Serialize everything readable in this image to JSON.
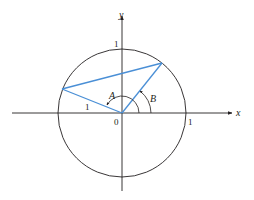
{
  "diagram": {
    "type": "unit-circle",
    "colors": {
      "axis": "#231f20",
      "circle": "#231f20",
      "radii_and_chord": "#4a8fd6",
      "background": "#ffffff"
    },
    "axes": {
      "x_label": "x",
      "y_label": "y",
      "origin_label": "0",
      "x_tick_label": "1",
      "y_tick_label": "1"
    },
    "angles": {
      "A_label": "A",
      "B_label": "B"
    },
    "radius_label": "1"
  }
}
